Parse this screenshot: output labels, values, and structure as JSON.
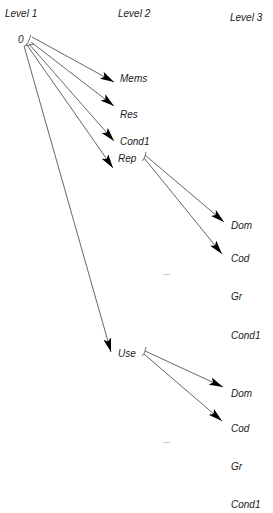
{
  "headers": {
    "level1": "Level 1",
    "level2": "Level 2",
    "level3": "Level 3"
  },
  "root": {
    "label": "0"
  },
  "level2_nodes": [
    {
      "label": "Mems"
    },
    {
      "label": "Res"
    },
    {
      "label": "Cond1"
    },
    {
      "label": "Rep"
    },
    {
      "label": "Use"
    }
  ],
  "rep_children": [
    {
      "label": "Dom"
    },
    {
      "label": "Cod"
    },
    {
      "label": "..."
    },
    {
      "label": "Gr"
    },
    {
      "label": "Cond1"
    }
  ],
  "use_children": [
    {
      "label": "Dom"
    },
    {
      "label": "Cod"
    },
    {
      "label": "..."
    },
    {
      "label": "Gr"
    },
    {
      "label": "Cond1"
    }
  ],
  "colors": {
    "line": "#555555",
    "arrowhead": "#000000",
    "text": "#1a1a1a"
  }
}
